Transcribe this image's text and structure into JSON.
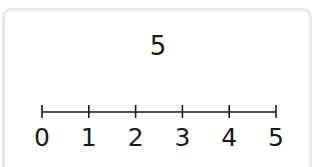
{
  "question": {
    "value_label": "5"
  },
  "number_line": {
    "min": 0,
    "max": 5,
    "step": 1,
    "tick_labels": [
      "0",
      "1",
      "2",
      "3",
      "4",
      "5"
    ],
    "line_color": "#1a1a1a",
    "label_color": "#1a1a1a"
  }
}
